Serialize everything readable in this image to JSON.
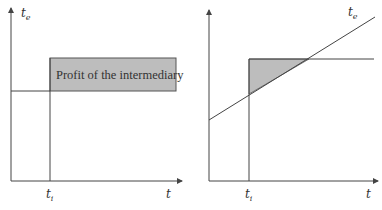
{
  "left_diagram": {
    "y_axis_label": "t",
    "y_axis_label_sub": "e",
    "x_axis_label": "t",
    "x_marker_label": "t",
    "x_marker_label_sub": "i",
    "box_label": "Profit of the intermediary",
    "fill_color": "#bdbdbd",
    "line_color": "#444444"
  },
  "right_diagram": {
    "line_label": "t",
    "line_label_sub": "e",
    "x_axis_label": "t",
    "x_marker_label": "t",
    "x_marker_label_sub": "i",
    "fill_color": "#bdbdbd",
    "line_color": "#444444"
  }
}
